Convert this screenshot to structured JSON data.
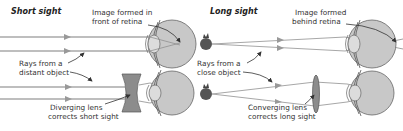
{
  "panels": {
    "short_sight": {
      "title": "Short sight",
      "label_image": [
        "Image formed in",
        "front of retina"
      ],
      "label_rays": [
        "Rays from a",
        "distant object"
      ],
      "label_lens": [
        "Diverging lens",
        "corrects short sight"
      ],
      "lens_type": "diverging"
    },
    "long_sight": {
      "title": "Long sight",
      "label_image": [
        "Image formed",
        "behind retina"
      ],
      "label_rays": [
        "Rays from a",
        "close object"
      ],
      "label_lens": [
        "Converging lens",
        "corrects long sight"
      ],
      "lens_type": "converging"
    }
  },
  "colors": {
    "ray": "#a8a8a8",
    "eye_fill": "#c8c8c8",
    "lens_fill": "#8c8c8c",
    "object_fill": "#555555",
    "text": "#333333"
  }
}
